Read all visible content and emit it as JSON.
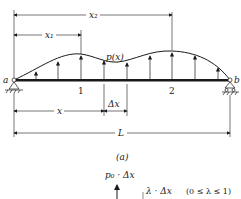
{
  "figure": {
    "caption": "(a)",
    "load_label": "p(x)",
    "support_left": "a",
    "support_right": "b",
    "point_1": "1",
    "point_2": "2",
    "dim_x2": "x₂",
    "dim_x1": "x₁",
    "dim_x": "x",
    "dim_dx": "Δx",
    "dim_L": "L"
  },
  "detail": {
    "force_label": "p₀ · Δx",
    "lambda_label": "λ · Δx",
    "lambda_range": "(0 ≤ λ ≤ 1)"
  },
  "colors": {
    "ink": "#1a1a1a",
    "background": "#ffffff"
  }
}
